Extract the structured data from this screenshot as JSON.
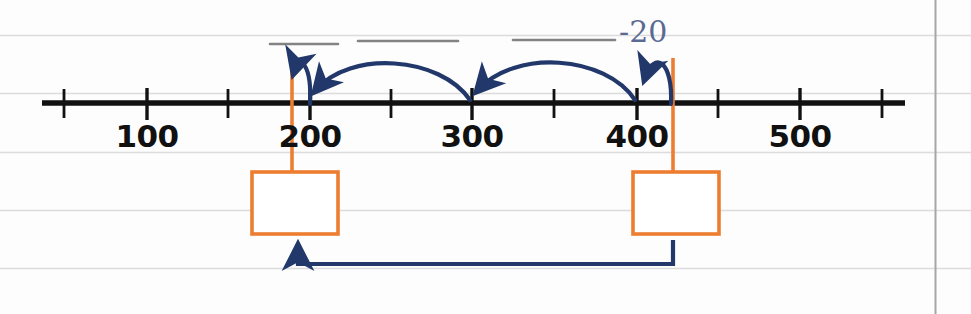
{
  "worksheet": {
    "title": "Number line subtraction jump strategy",
    "paper": {
      "background_color": "#fdfdfd",
      "grid_line_color": "#d8d8d8",
      "margin_line_color": "#9a9a9a"
    },
    "colors": {
      "number_line": "#111111",
      "annotation_blue": "#22386b",
      "highlight_orange": "#ed7d31",
      "blank_line_gray": "#7a7a7a",
      "handwriting_blue": "#5a6a93"
    }
  },
  "number_line": {
    "axis_label": "",
    "tick_labels": [
      "100",
      "200",
      "300",
      "400",
      "500"
    ],
    "tick_values": [
      100,
      200,
      300,
      400,
      500
    ],
    "minor_ticks_per_interval": 2,
    "range_start": 50,
    "range_end": 550
  },
  "jumps": [
    {
      "id": "jump-1",
      "from": 200,
      "to": 190,
      "label": "",
      "direction": "left",
      "size": "small"
    },
    {
      "id": "jump-2",
      "from": 300,
      "to": 200,
      "label": "",
      "direction": "left",
      "size": "large"
    },
    {
      "id": "jump-3",
      "from": 400,
      "to": 300,
      "label": "",
      "direction": "left",
      "size": "large"
    },
    {
      "id": "jump-4",
      "from": 420,
      "to": 400,
      "label": "-20",
      "direction": "left",
      "size": "small"
    }
  ],
  "blank_answer_lines": [
    {
      "id": "blank-line-1",
      "text": ""
    },
    {
      "id": "blank-line-2",
      "text": ""
    },
    {
      "id": "blank-line-3",
      "text": ""
    }
  ],
  "annotations": {
    "jump_value_label": "-20"
  },
  "answer_boxes": [
    {
      "id": "answer-box-left",
      "value": "",
      "anchored_to": 190
    },
    {
      "id": "answer-box-right",
      "value": "",
      "anchored_to": 420
    }
  ],
  "connector": {
    "id": "answer-connector-arrow",
    "label": "",
    "from_box": "answer-box-right",
    "to_box": "answer-box-left",
    "direction": "right-to-left"
  }
}
